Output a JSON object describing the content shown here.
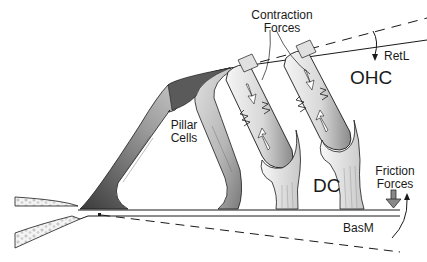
{
  "diagram": {
    "labels": {
      "contraction_line1": "Contraction",
      "contraction_line2": "Forces",
      "retl": "RetL",
      "ohc": "OHC",
      "pillar_line1": "Pillar",
      "pillar_line2": "Cells",
      "dc": "DC",
      "friction_line1": "Friction",
      "friction_line2": "Forces",
      "basm": "BasM"
    },
    "colors": {
      "ink": "#1a1a1a",
      "cell_light": "#f2f2f2",
      "cell_mid": "#a8a8a8",
      "cell_dark": "#4a4a4a",
      "background": "#ffffff"
    }
  }
}
